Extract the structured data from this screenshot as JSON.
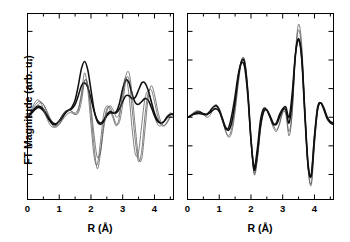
{
  "figure": {
    "ylabel": "FT Magnitude (arb. u.)",
    "xlabel": "R (Å)",
    "panels": [
      "left",
      "right"
    ]
  },
  "axis": {
    "xticklabels": [
      "0",
      "1",
      "2",
      "3",
      "4"
    ],
    "xtickvalues": [
      0,
      1,
      2,
      3,
      4
    ],
    "xmin": 0,
    "xmax": 4.6,
    "xminor_step": 0.5,
    "yticks_labeled": false,
    "ymin": -1.15,
    "ymax": 1.45,
    "ytick_step": 0.4,
    "frame_color": "#000000",
    "line_color_thin": "#555555",
    "line_color_thick": "#111111"
  },
  "chart_data": {
    "type": "line",
    "title": "",
    "xlabel": "R (Å)",
    "ylabel": "FT Magnitude (arb. u.)",
    "xlim": [
      0,
      4.6
    ],
    "ylim": [
      -1.15,
      1.45
    ],
    "grid": false,
    "legend": "none",
    "panels": [
      {
        "name": "left",
        "series": [
          {
            "name": "thin-curve-1",
            "weight": "thin",
            "x": [
              0.0,
              0.1,
              0.2,
              0.3,
              0.4,
              0.5,
              0.6,
              0.7,
              0.8,
              0.9,
              1.0,
              1.1,
              1.2,
              1.3,
              1.4,
              1.5,
              1.6,
              1.7,
              1.8,
              1.9,
              2.0,
              2.1,
              2.2,
              2.3,
              2.4,
              2.5,
              2.6,
              2.7,
              2.8,
              2.9,
              3.0,
              3.1,
              3.2,
              3.3,
              3.4,
              3.5,
              3.6,
              3.7,
              3.8,
              3.9,
              4.0,
              4.1,
              4.2,
              4.3,
              4.4,
              4.5,
              4.6
            ],
            "y": [
              0.0,
              0.06,
              0.14,
              0.2,
              0.22,
              0.18,
              0.08,
              -0.04,
              -0.12,
              -0.14,
              -0.1,
              -0.04,
              0.02,
              0.06,
              0.06,
              0.04,
              0.1,
              0.34,
              0.62,
              0.38,
              -0.1,
              -0.55,
              -0.66,
              -0.34,
              0.04,
              0.16,
              0.1,
              -0.02,
              -0.12,
              0.02,
              0.38,
              0.56,
              0.3,
              -0.18,
              -0.52,
              -0.48,
              -0.1,
              0.26,
              0.36,
              0.22,
              0.02,
              -0.1,
              -0.12,
              -0.06,
              0.02,
              0.06,
              0.04
            ]
          },
          {
            "name": "thin-curve-2",
            "weight": "thin",
            "x": [
              0.0,
              0.1,
              0.2,
              0.3,
              0.4,
              0.5,
              0.6,
              0.7,
              0.8,
              0.9,
              1.0,
              1.1,
              1.2,
              1.3,
              1.4,
              1.5,
              1.6,
              1.7,
              1.8,
              1.9,
              2.0,
              2.1,
              2.2,
              2.3,
              2.4,
              2.5,
              2.6,
              2.7,
              2.8,
              2.9,
              3.0,
              3.1,
              3.2,
              3.3,
              3.4,
              3.5,
              3.6,
              3.7,
              3.8,
              3.9,
              4.0,
              4.1,
              4.2,
              4.3,
              4.4,
              4.5,
              4.6
            ],
            "y": [
              0.0,
              0.04,
              0.1,
              0.16,
              0.2,
              0.18,
              0.1,
              0.0,
              -0.08,
              -0.12,
              -0.1,
              -0.02,
              0.06,
              0.1,
              0.08,
              0.04,
              0.06,
              0.22,
              0.5,
              0.46,
              0.06,
              -0.42,
              -0.72,
              -0.5,
              -0.1,
              0.12,
              0.14,
              0.02,
              -0.1,
              -0.06,
              0.18,
              0.52,
              0.52,
              0.1,
              -0.34,
              -0.62,
              -0.46,
              0.02,
              0.34,
              0.38,
              0.22,
              0.02,
              -0.1,
              -0.12,
              -0.06,
              0.02,
              0.06
            ]
          },
          {
            "name": "thick-curve-1",
            "weight": "thick",
            "x": [
              0.0,
              0.1,
              0.2,
              0.3,
              0.4,
              0.5,
              0.6,
              0.7,
              0.8,
              0.9,
              1.0,
              1.1,
              1.2,
              1.3,
              1.4,
              1.5,
              1.6,
              1.7,
              1.8,
              1.9,
              2.0,
              2.1,
              2.2,
              2.3,
              2.4,
              2.5,
              2.6,
              2.7,
              2.8,
              2.9,
              3.0,
              3.1,
              3.2,
              3.3,
              3.4,
              3.5,
              3.6,
              3.7,
              3.8,
              3.9,
              4.0,
              4.1,
              4.2,
              4.3,
              4.4,
              4.5,
              4.6
            ],
            "y": [
              0.0,
              0.05,
              0.11,
              0.15,
              0.15,
              0.11,
              0.04,
              -0.03,
              -0.08,
              -0.09,
              -0.06,
              0.0,
              0.06,
              0.1,
              0.14,
              0.24,
              0.44,
              0.68,
              0.78,
              0.66,
              0.38,
              0.1,
              -0.06,
              -0.1,
              -0.06,
              0.02,
              0.06,
              0.06,
              0.08,
              0.2,
              0.4,
              0.52,
              0.48,
              0.32,
              0.2,
              0.18,
              0.22,
              0.26,
              0.24,
              0.14,
              0.02,
              -0.06,
              -0.08,
              -0.06,
              0.0,
              0.04,
              0.04
            ]
          },
          {
            "name": "thick-curve-2",
            "weight": "thick",
            "x": [
              0.0,
              0.1,
              0.2,
              0.3,
              0.4,
              0.5,
              0.6,
              0.7,
              0.8,
              0.9,
              1.0,
              1.1,
              1.2,
              1.3,
              1.4,
              1.5,
              1.6,
              1.7,
              1.8,
              1.9,
              2.0,
              2.1,
              2.2,
              2.3,
              2.4,
              2.5,
              2.6,
              2.7,
              2.8,
              2.9,
              3.0,
              3.1,
              3.2,
              3.3,
              3.4,
              3.5,
              3.6,
              3.7,
              3.8,
              3.9,
              4.0,
              4.1,
              4.2,
              4.3,
              4.4,
              4.5,
              4.6
            ],
            "y": [
              0.0,
              0.04,
              0.09,
              0.13,
              0.13,
              0.09,
              0.02,
              -0.05,
              -0.1,
              -0.1,
              -0.05,
              0.02,
              0.08,
              0.1,
              0.12,
              0.18,
              0.3,
              0.44,
              0.48,
              0.42,
              0.26,
              0.08,
              -0.04,
              -0.08,
              -0.04,
              0.04,
              0.08,
              0.06,
              0.06,
              0.12,
              0.22,
              0.3,
              0.3,
              0.26,
              0.28,
              0.38,
              0.48,
              0.48,
              0.38,
              0.22,
              0.06,
              -0.04,
              -0.08,
              -0.06,
              0.0,
              0.04,
              0.04
            ]
          },
          {
            "name": "thin-curve-3",
            "weight": "thin",
            "x": [
              0.0,
              0.1,
              0.2,
              0.3,
              0.4,
              0.5,
              0.6,
              0.7,
              0.8,
              0.9,
              1.0,
              1.1,
              1.2,
              1.3,
              1.4,
              1.5,
              1.6,
              1.7,
              1.8,
              1.9,
              2.0,
              2.1,
              2.2,
              2.3,
              2.4,
              2.5,
              2.6,
              2.7,
              2.8,
              2.9,
              3.0,
              3.1,
              3.2,
              3.3,
              3.4,
              3.5,
              3.6,
              3.7,
              3.8,
              3.9,
              4.0,
              4.1,
              4.2,
              4.3,
              4.4,
              4.5,
              4.6
            ],
            "y": [
              0.0,
              0.08,
              0.18,
              0.24,
              0.22,
              0.12,
              0.0,
              -0.1,
              -0.14,
              -0.12,
              -0.06,
              0.02,
              0.08,
              0.1,
              0.08,
              0.06,
              0.12,
              0.3,
              0.52,
              0.44,
              0.14,
              -0.26,
              -0.56,
              -0.48,
              -0.16,
              0.08,
              0.16,
              0.1,
              0.0,
              0.06,
              0.3,
              0.58,
              0.62,
              0.3,
              -0.16,
              -0.56,
              -0.58,
              -0.18,
              0.26,
              0.44,
              0.32,
              0.1,
              -0.06,
              -0.12,
              -0.08,
              0.0,
              0.04
            ]
          }
        ]
      },
      {
        "name": "right",
        "series": [
          {
            "name": "thin-curve-1",
            "weight": "thin",
            "x": [
              0.0,
              0.1,
              0.2,
              0.3,
              0.4,
              0.5,
              0.6,
              0.7,
              0.8,
              0.9,
              1.0,
              1.1,
              1.2,
              1.3,
              1.4,
              1.5,
              1.6,
              1.7,
              1.8,
              1.9,
              2.0,
              2.1,
              2.2,
              2.3,
              2.4,
              2.5,
              2.6,
              2.7,
              2.8,
              2.9,
              3.0,
              3.1,
              3.2,
              3.3,
              3.4,
              3.5,
              3.6,
              3.7,
              3.8,
              3.9,
              4.0,
              4.1,
              4.2,
              4.3,
              4.4,
              4.5,
              4.6
            ],
            "y": [
              0.0,
              0.02,
              0.06,
              0.08,
              0.08,
              0.04,
              0.0,
              0.02,
              0.1,
              0.16,
              0.12,
              0.0,
              -0.18,
              -0.28,
              -0.2,
              0.08,
              0.46,
              0.78,
              0.8,
              0.4,
              -0.3,
              -0.8,
              -0.6,
              -0.18,
              0.06,
              0.1,
              0.02,
              -0.1,
              -0.18,
              -0.1,
              0.06,
              0.06,
              -0.2,
              0.1,
              0.9,
              1.3,
              1.0,
              0.1,
              -0.7,
              -0.95,
              -0.4,
              0.08,
              0.2,
              0.14,
              0.02,
              -0.06,
              -0.08
            ]
          },
          {
            "name": "thin-curve-2",
            "weight": "thin",
            "x": [
              0.0,
              0.1,
              0.2,
              0.3,
              0.4,
              0.5,
              0.6,
              0.7,
              0.8,
              0.9,
              1.0,
              1.1,
              1.2,
              1.3,
              1.4,
              1.5,
              1.6,
              1.7,
              1.8,
              1.9,
              2.0,
              2.1,
              2.2,
              2.3,
              2.4,
              2.5,
              2.6,
              2.7,
              2.8,
              2.9,
              3.0,
              3.1,
              3.2,
              3.3,
              3.4,
              3.5,
              3.6,
              3.7,
              3.8,
              3.9,
              4.0,
              4.1,
              4.2,
              4.3,
              4.4,
              4.5,
              4.6
            ],
            "y": [
              0.0,
              0.03,
              0.07,
              0.09,
              0.08,
              0.04,
              0.02,
              0.06,
              0.14,
              0.18,
              0.12,
              -0.02,
              -0.2,
              -0.26,
              -0.14,
              0.14,
              0.52,
              0.8,
              0.78,
              0.34,
              -0.34,
              -0.78,
              -0.56,
              -0.14,
              0.08,
              0.1,
              0.0,
              -0.14,
              -0.2,
              -0.08,
              0.08,
              0.04,
              -0.26,
              0.06,
              0.86,
              1.22,
              0.92,
              0.04,
              -0.72,
              -0.92,
              -0.36,
              0.1,
              0.2,
              0.12,
              0.0,
              -0.08,
              -0.1
            ]
          },
          {
            "name": "thick-curve-1",
            "weight": "thick",
            "x": [
              0.0,
              0.1,
              0.2,
              0.3,
              0.4,
              0.5,
              0.6,
              0.7,
              0.8,
              0.9,
              1.0,
              1.1,
              1.2,
              1.3,
              1.4,
              1.5,
              1.6,
              1.7,
              1.8,
              1.9,
              2.0,
              2.1,
              2.2,
              2.3,
              2.4,
              2.5,
              2.6,
              2.7,
              2.8,
              2.9,
              3.0,
              3.1,
              3.2,
              3.3,
              3.4,
              3.5,
              3.6,
              3.7,
              3.8,
              3.9,
              4.0,
              4.1,
              4.2,
              4.3,
              4.4,
              4.5,
              4.6
            ],
            "y": [
              0.0,
              0.02,
              0.05,
              0.07,
              0.07,
              0.05,
              0.04,
              0.06,
              0.1,
              0.12,
              0.08,
              -0.02,
              -0.14,
              -0.18,
              -0.06,
              0.22,
              0.56,
              0.78,
              0.76,
              0.36,
              -0.3,
              -0.74,
              -0.52,
              -0.12,
              0.08,
              0.1,
              0.02,
              -0.08,
              -0.1,
              0.0,
              0.1,
              0.1,
              -0.08,
              0.24,
              0.86,
              1.1,
              0.84,
              0.06,
              -0.66,
              -0.82,
              -0.3,
              0.12,
              0.2,
              0.12,
              0.0,
              -0.06,
              -0.08
            ]
          },
          {
            "name": "thick-curve-2",
            "weight": "thick",
            "x": [
              0.0,
              0.1,
              0.2,
              0.3,
              0.4,
              0.5,
              0.6,
              0.7,
              0.8,
              0.9,
              1.0,
              1.1,
              1.2,
              1.3,
              1.4,
              1.5,
              1.6,
              1.7,
              1.8,
              1.9,
              2.0,
              2.1,
              2.2,
              2.3,
              2.4,
              2.5,
              2.6,
              2.7,
              2.8,
              2.9,
              3.0,
              3.1,
              3.2,
              3.3,
              3.4,
              3.5,
              3.6,
              3.7,
              3.8,
              3.9,
              4.0,
              4.1,
              4.2,
              4.3,
              4.4,
              4.5,
              4.6
            ],
            "y": [
              0.0,
              0.02,
              0.04,
              0.05,
              0.05,
              0.04,
              0.04,
              0.08,
              0.14,
              0.16,
              0.1,
              -0.04,
              -0.16,
              -0.14,
              0.04,
              0.3,
              0.6,
              0.76,
              0.7,
              0.3,
              -0.32,
              -0.7,
              -0.44,
              -0.04,
              0.12,
              0.1,
              0.0,
              -0.1,
              -0.08,
              0.04,
              0.12,
              0.14,
              0.0,
              0.34,
              0.88,
              1.08,
              0.8,
              0.0,
              -0.68,
              -0.8,
              -0.26,
              0.14,
              0.2,
              0.1,
              -0.02,
              -0.08,
              -0.1
            ]
          }
        ]
      }
    ]
  }
}
